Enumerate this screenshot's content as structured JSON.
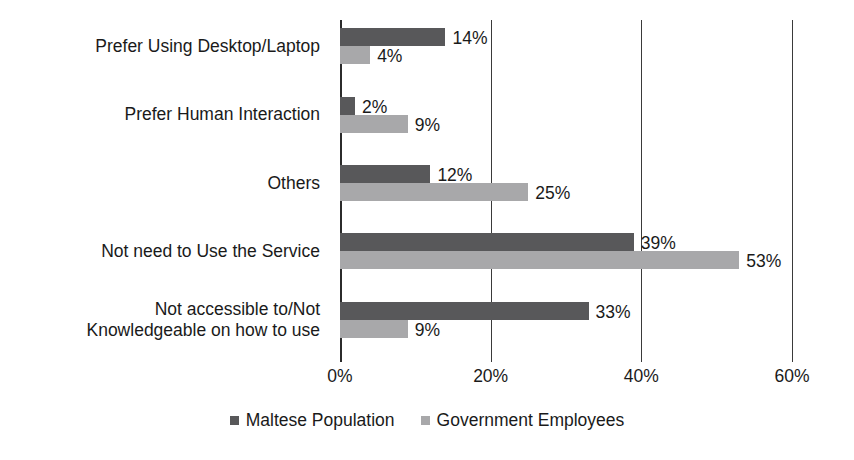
{
  "chart_data": {
    "type": "bar",
    "orientation": "horizontal",
    "title": "",
    "xlabel": "",
    "ylabel": "",
    "xlim": [
      0,
      60
    ],
    "grid": true,
    "gridlines_vertical": [
      0,
      20,
      40,
      60
    ],
    "legend_position": "bottom-center",
    "tick_labels": [
      "0%",
      "20%",
      "40%",
      "60%"
    ],
    "tick_values": [
      0,
      20,
      40,
      60
    ],
    "categories": [
      "Prefer Using Desktop/Laptop",
      "Prefer Human Interaction",
      "Others",
      "Not need to Use the Service",
      "Not accessible to/Not\nKnowledgeable on how to use"
    ],
    "series": [
      {
        "name": "Maltese Population",
        "color": "#58585a",
        "values": [
          14,
          2,
          12,
          39,
          33
        ],
        "value_labels": [
          "14%",
          "2%",
          "12%",
          "39%",
          "33%"
        ]
      },
      {
        "name": "Government Employees",
        "color": "#a8a8aa",
        "values": [
          4,
          9,
          25,
          53,
          9
        ],
        "value_labels": [
          "4%",
          "9%",
          "25%",
          "53%",
          "9%"
        ]
      }
    ]
  },
  "legend": {
    "items": [
      {
        "label": "Maltese Population",
        "color": "#58585a",
        "swatch_name": "legend-swatch-maltese-population"
      },
      {
        "label": "Government Employees",
        "color": "#a8a8aa",
        "swatch_name": "legend-swatch-government-employees"
      }
    ]
  }
}
